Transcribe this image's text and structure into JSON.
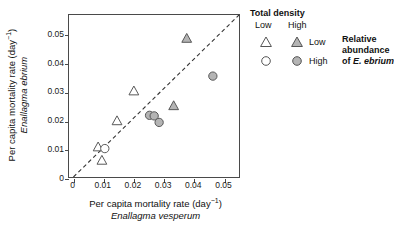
{
  "chart_data": {
    "type": "scatter",
    "title": "",
    "xlabel": "Per capita mortality rate (day⁻¹) Enallagma vesperum",
    "ylabel": "Per capita mortality rate (day⁻¹) Enallagma ebrium",
    "xlim": [
      0,
      0.057
    ],
    "ylim": [
      0,
      0.057
    ],
    "xticks": [
      0,
      0.01,
      0.02,
      0.03,
      0.04,
      0.05
    ],
    "yticks": [
      0,
      0.01,
      0.02,
      0.03,
      0.04,
      0.05
    ],
    "xtick_labels": [
      "0",
      "0.01",
      "0.02",
      "0.03",
      "0.04",
      "0.05"
    ],
    "ytick_labels": [
      "0",
      "0.01",
      "0.02",
      "0.03",
      "0.04",
      "0.05"
    ],
    "grid": false,
    "reference_line": {
      "type": "1:1 dashed",
      "from": [
        0,
        0
      ],
      "to": [
        0.057,
        0.057
      ],
      "style": "dashed",
      "color": "#333333"
    },
    "series": [
      {
        "name": "Low density, Low relative abundance",
        "marker": "triangle",
        "fill": "open",
        "color": "#ffffff",
        "edge": "#555555",
        "points": [
          {
            "x": 0.0085,
            "y": 0.0105
          },
          {
            "x": 0.0098,
            "y": 0.0058
          },
          {
            "x": 0.015,
            "y": 0.0197
          },
          {
            "x": 0.0208,
            "y": 0.0302
          }
        ]
      },
      {
        "name": "High density, Low relative abundance",
        "marker": "triangle",
        "fill": "shaded",
        "color": "#b4b4b4",
        "edge": "#555555",
        "points": [
          {
            "x": 0.0345,
            "y": 0.025
          },
          {
            "x": 0.039,
            "y": 0.0487
          }
        ]
      },
      {
        "name": "Low density, High relative abundance",
        "marker": "circle",
        "fill": "open",
        "color": "#ffffff",
        "edge": "#555555",
        "points": [
          {
            "x": 0.0108,
            "y": 0.01
          }
        ]
      },
      {
        "name": "High density, High relative abundance",
        "marker": "circle",
        "fill": "shaded",
        "color": "#b4b4b4",
        "edge": "#555555",
        "points": [
          {
            "x": 0.0262,
            "y": 0.0217
          },
          {
            "x": 0.0278,
            "y": 0.0215
          },
          {
            "x": 0.0295,
            "y": 0.0192
          },
          {
            "x": 0.048,
            "y": 0.0355
          }
        ]
      }
    ]
  },
  "axes": {
    "x_title_line1": "Per capita mortality rate (day",
    "x_title_sup": "−1",
    "x_title_line1_end": ")",
    "x_title_species": "Enallagma vesperum",
    "y_title_line1": "Per capita mortality rate (day",
    "y_title_sup": "−1",
    "y_title_line1_end": ")",
    "y_title_species": "Enallagma ebrium"
  },
  "legend": {
    "title": "Total density",
    "col_low": "Low",
    "col_high": "High",
    "row_low": "Low",
    "row_high": "High",
    "caption_line1": "Relative",
    "caption_line2": "abundance",
    "caption_line3_prefix": "of ",
    "caption_line3_species": "E. ebrium"
  }
}
